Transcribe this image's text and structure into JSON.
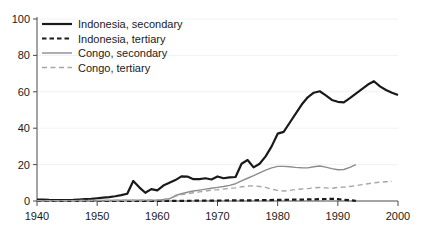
{
  "chart_data": {
    "type": "line",
    "title": "",
    "xlabel": "",
    "ylabel": "",
    "xlim": [
      1940,
      2000
    ],
    "ylim": [
      0,
      100
    ],
    "xticks": [
      1940,
      1950,
      1960,
      1970,
      1980,
      1990,
      2000
    ],
    "yticks": [
      0,
      20,
      40,
      60,
      80,
      100
    ],
    "grid": true,
    "legend_position": "top-left",
    "series": [
      {
        "name": "Indonesia, secondary",
        "style": "solid",
        "color": "#1a1a1a",
        "width": 2.2,
        "x": [
          1940,
          1941,
          1942,
          1943,
          1944,
          1945,
          1946,
          1947,
          1948,
          1949,
          1950,
          1951,
          1952,
          1953,
          1954,
          1955,
          1956,
          1957,
          1958,
          1959,
          1960,
          1961,
          1962,
          1963,
          1964,
          1965,
          1966,
          1967,
          1968,
          1969,
          1970,
          1971,
          1972,
          1973,
          1974,
          1975,
          1976,
          1977,
          1978,
          1979,
          1980,
          1981,
          1982,
          1983,
          1984,
          1985,
          1986,
          1987,
          1988,
          1989,
          1990,
          1991,
          1992,
          1993,
          1994,
          1995,
          1996,
          1997,
          1998,
          1999,
          2000
        ],
        "y": [
          0.8,
          0.8,
          0.6,
          0.5,
          0.5,
          0.5,
          0.6,
          0.8,
          1.0,
          1.2,
          1.5,
          1.8,
          2.1,
          2.6,
          3.2,
          4.0,
          11.0,
          7.5,
          4.5,
          6.5,
          5.8,
          8.5,
          10.0,
          11.5,
          13.5,
          13.4,
          12.0,
          12.0,
          12.5,
          11.8,
          13.5,
          12.5,
          13.0,
          13.2,
          20.5,
          22.5,
          18.5,
          20.5,
          24.5,
          30.0,
          37.0,
          38.0,
          43.0,
          48.0,
          53.0,
          57.0,
          59.5,
          60.3,
          58.0,
          55.5,
          54.5,
          54.2,
          56.5,
          59.0,
          61.5,
          64.0,
          65.8,
          63.0,
          61.0,
          59.5,
          58.2
        ]
      },
      {
        "name": "Indonesia, tertiary",
        "style": "dashed",
        "color": "#1a1a1a",
        "width": 2.2,
        "x": [
          1940,
          1945,
          1950,
          1955,
          1960,
          1962,
          1964,
          1966,
          1968,
          1970,
          1972,
          1974,
          1976,
          1978,
          1980,
          1982,
          1984,
          1986,
          1988,
          1989,
          1990,
          1991,
          1992,
          1993
        ],
        "y": [
          0.0,
          0.0,
          0.0,
          0.0,
          0.0,
          0.05,
          0.1,
          0.15,
          0.2,
          0.25,
          0.3,
          0.35,
          0.4,
          0.5,
          0.6,
          0.7,
          0.8,
          0.9,
          1.1,
          1.2,
          1.0,
          0.7,
          0.4,
          0.1
        ]
      },
      {
        "name": "Congo, secondary",
        "style": "solid",
        "color": "#8c8c8c",
        "width": 1.4,
        "x": [
          1940,
          1945,
          1950,
          1955,
          1958,
          1960,
          1961,
          1962,
          1963,
          1964,
          1965,
          1966,
          1967,
          1968,
          1969,
          1970,
          1971,
          1972,
          1973,
          1974,
          1975,
          1976,
          1977,
          1978,
          1979,
          1980,
          1981,
          1982,
          1983,
          1984,
          1985,
          1986,
          1987,
          1988,
          1989,
          1990,
          1991,
          1992,
          1993
        ],
        "y": [
          0.2,
          0.2,
          0.3,
          0.4,
          0.5,
          0.6,
          0.8,
          1.2,
          3.0,
          4.0,
          4.8,
          5.5,
          6.0,
          6.5,
          7.0,
          7.5,
          8.0,
          8.6,
          9.5,
          11.0,
          12.5,
          14.0,
          15.5,
          17.0,
          18.2,
          19.0,
          19.0,
          18.8,
          18.5,
          18.3,
          18.2,
          18.8,
          19.2,
          18.6,
          17.8,
          17.2,
          17.3,
          18.5,
          20.0
        ]
      },
      {
        "name": "Congo, tertiary",
        "style": "dashed",
        "color": "#a6a6a6",
        "width": 1.4,
        "x": [
          1940,
          1945,
          1950,
          1955,
          1958,
          1960,
          1961,
          1962,
          1963,
          1964,
          1965,
          1966,
          1967,
          1968,
          1969,
          1970,
          1971,
          1972,
          1973,
          1974,
          1975,
          1976,
          1977,
          1978,
          1979,
          1980,
          1981,
          1982,
          1983,
          1984,
          1985,
          1986,
          1987,
          1988,
          1989,
          1990,
          1991,
          1992,
          1993,
          1994,
          1995,
          1996,
          1997,
          1998,
          1999
        ],
        "y": [
          0.2,
          0.2,
          0.3,
          0.4,
          0.5,
          0.6,
          0.8,
          1.0,
          2.5,
          3.5,
          4.0,
          4.5,
          5.0,
          5.5,
          6.0,
          6.2,
          6.5,
          7.0,
          7.2,
          7.8,
          8.2,
          8.3,
          8.0,
          7.5,
          6.5,
          5.8,
          5.5,
          5.8,
          6.3,
          6.6,
          6.8,
          7.2,
          7.4,
          7.2,
          7.0,
          7.5,
          7.6,
          8.0,
          8.4,
          9.0,
          9.5,
          10.0,
          10.3,
          10.6,
          10.8
        ]
      }
    ]
  },
  "legend": {
    "items": [
      {
        "label": "Indonesia, secondary"
      },
      {
        "label": "Indonesia, tertiary"
      },
      {
        "label": "Congo, secondary"
      },
      {
        "label": "Congo, tertiary"
      }
    ]
  }
}
